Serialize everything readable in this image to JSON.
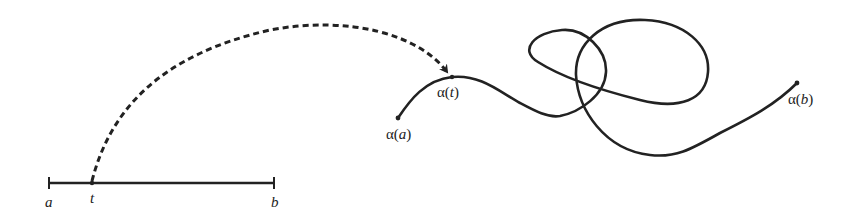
{
  "diagram": {
    "type": "parametrized-curve",
    "interval": {
      "start_label": "a",
      "point_label": "t",
      "end_label": "b"
    },
    "curve": {
      "start_label_prefix": "α(",
      "start_label_var": "a",
      "start_label_suffix": ")",
      "point_label_prefix": "α(",
      "point_label_var": "t",
      "point_label_suffix": ")",
      "end_label_prefix": "α(",
      "end_label_var": "b",
      "end_label_suffix": ")"
    },
    "mapping_arrow": "dashed arrow from t to α(t)",
    "colors": {
      "stroke": "#222222",
      "background": "#ffffff"
    }
  }
}
